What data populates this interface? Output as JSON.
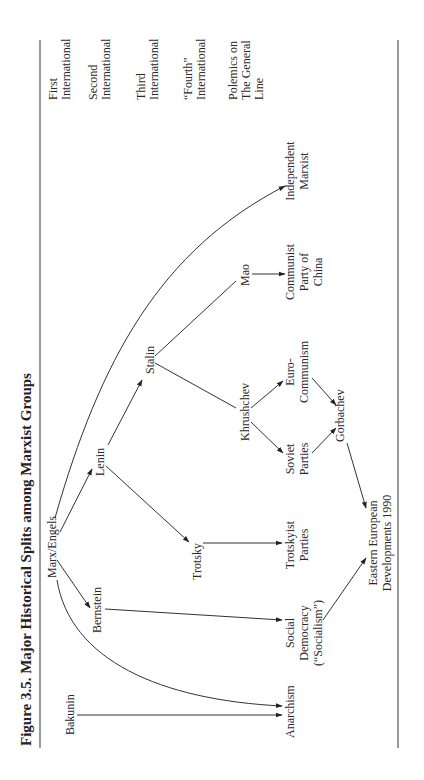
{
  "figure": {
    "title": "Figure 3.5.  Major Historical Splits among Marxist Groups"
  },
  "columns": [
    {
      "lines": [
        "First",
        "International"
      ]
    },
    {
      "lines": [
        "Second",
        "International"
      ]
    },
    {
      "lines": [
        "Third",
        "International"
      ]
    },
    {
      "lines": [
        "“Fourth”",
        "International"
      ]
    },
    {
      "lines": [
        "Polemics on",
        "The General",
        "Line"
      ]
    }
  ],
  "nodes": {
    "marx_engels": {
      "lines": [
        "Marx/Engels"
      ]
    },
    "bakunin": {
      "lines": [
        "Bakunin"
      ]
    },
    "bernstein": {
      "lines": [
        "Bernstein"
      ]
    },
    "lenin": {
      "lines": [
        "Lenin"
      ]
    },
    "trotsky": {
      "lines": [
        "Trotsky"
      ]
    },
    "stalin": {
      "lines": [
        "Stalin"
      ]
    },
    "khrushchev": {
      "lines": [
        "Khrushchev"
      ]
    },
    "mao": {
      "lines": [
        "Mao"
      ]
    },
    "anarchism": {
      "lines": [
        "Anarchism"
      ]
    },
    "social_democracy": {
      "lines": [
        "Social",
        "Democracy",
        "(“Socialism”)"
      ]
    },
    "trotskyist_parties": {
      "lines": [
        "Trotskyist",
        "Parties"
      ]
    },
    "soviet_parties": {
      "lines": [
        "Soviet",
        "Parties"
      ]
    },
    "euro_communism": {
      "lines": [
        "Euro-",
        "Communism"
      ]
    },
    "communist_party_china": {
      "lines": [
        "Communist",
        "Party of",
        "China"
      ]
    },
    "independent_marxist": {
      "lines": [
        "Independent",
        "Marxist"
      ]
    },
    "gorbachev": {
      "lines": [
        "Gorbachev"
      ]
    },
    "eastern_european": {
      "lines": [
        "Eastern European",
        "Developments 1990"
      ]
    }
  },
  "edges": [
    {
      "from": "Bakunin",
      "to": "Anarchism"
    },
    {
      "from": "Marx/Engels",
      "to": "Anarchism"
    },
    {
      "from": "Marx/Engels",
      "to": "Bernstein"
    },
    {
      "from": "Marx/Engels",
      "to": "Lenin"
    },
    {
      "from": "Marx/Engels",
      "to": "Independent Marxist"
    },
    {
      "from": "Bernstein",
      "to": "Social Democracy"
    },
    {
      "from": "Lenin",
      "to": "Trotsky"
    },
    {
      "from": "Lenin",
      "to": "Stalin"
    },
    {
      "from": "Trotsky",
      "to": "Trotskyist Parties"
    },
    {
      "from": "Stalin",
      "to": "Mao"
    },
    {
      "from": "Stalin",
      "to": "Khrushchev"
    },
    {
      "from": "Mao",
      "to": "Communist Party of China"
    },
    {
      "from": "Khrushchev",
      "to": "Euro-Communism"
    },
    {
      "from": "Khrushchev",
      "to": "Soviet Parties"
    },
    {
      "from": "Euro-Communism",
      "to": "Gorbachev"
    },
    {
      "from": "Soviet Parties",
      "to": "Gorbachev"
    },
    {
      "from": "Gorbachev",
      "to": "Eastern European Developments 1990"
    },
    {
      "from": "Social Democracy",
      "to": "Eastern European Developments 1990"
    }
  ]
}
